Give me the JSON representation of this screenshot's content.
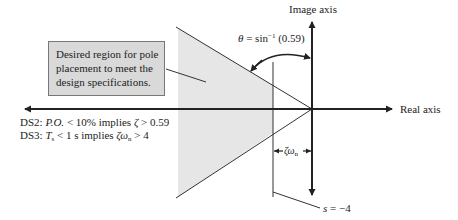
{
  "figure": {
    "axes": {
      "image_axis_label": "Image axis",
      "real_axis_label": "Real axis"
    },
    "angle_label": {
      "theta": "θ",
      "equals": " = sin",
      "superscript": "−1",
      "argument": " (0.59)"
    },
    "callout": {
      "lines": [
        "Desired region for pole",
        "placement to meet the",
        "design specifications."
      ]
    },
    "specs": {
      "ds2": {
        "prefix": "DS2: ",
        "var": "P.O.",
        "condition": " < 10% implies ",
        "zeta": "ζ",
        "result": " > 0.59"
      },
      "ds3": {
        "prefix": "DS3: ",
        "var": "T",
        "var_sub": "s",
        "condition": " < 1 s implies ",
        "zeta": "ζω",
        "zeta_sub": "n",
        "result": " > 4"
      }
    },
    "zeta_omega_label": {
      "text": "ζω",
      "sub": "n"
    },
    "boundary_label": {
      "s": "s",
      "value": " = −4"
    },
    "colors": {
      "region_fill": "#e6e6e6",
      "callout_fill": "#d9d9d9",
      "line": "#222222"
    },
    "parameters": {
      "damping_ratio_min": 0.59,
      "zeta_omega_n_min": 4,
      "percent_overshoot_max": "10%",
      "settling_time_max": "1 s",
      "boundary_s": -4
    }
  }
}
